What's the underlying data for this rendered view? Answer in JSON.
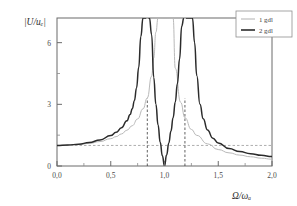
{
  "chart_data": {
    "type": "line",
    "title": "",
    "xlabel": "Ω/ωₐ",
    "ylabel": "|U/uₑ|",
    "xlim": [
      0.0,
      2.0
    ],
    "ylim": [
      0.0,
      7.2
    ],
    "grid": false,
    "legend_position": "top-right",
    "xticks": [
      "0,0",
      "0,5",
      "1,0",
      "1,5",
      "2,0"
    ],
    "xtick_values": [
      0.0,
      0.5,
      1.0,
      1.5,
      2.0
    ],
    "yticks": [
      "0",
      "3",
      "6"
    ],
    "ytick_values": [
      0,
      3,
      6
    ],
    "xtick_minor_values": [
      0.25,
      0.75,
      1.25,
      1.75
    ],
    "ytick_minor_values": [
      1.5,
      4.5
    ],
    "annotations": {
      "horizontal_reference_label": "1",
      "horizontal_reference_value": 1.0,
      "resonance_marker_left": 0.84,
      "resonance_marker_right": 1.19,
      "antiresonance": 1.0
    },
    "series": [
      {
        "name": "1 gdl",
        "color": "#b9b9b9",
        "style": "thin",
        "poles": [
          1.0
        ],
        "description": "Single degree of freedom response, one resonance peak at Ω/ω=1,0, asymptote to 1 at Ω=0",
        "x": [
          0.0,
          0.1,
          0.2,
          0.3,
          0.4,
          0.5,
          0.55,
          0.6,
          0.65,
          0.7,
          0.75,
          0.8,
          0.84,
          0.88,
          0.9,
          0.92,
          0.94,
          0.96,
          0.97,
          0.98,
          1.02,
          1.03,
          1.04,
          1.06,
          1.08,
          1.1,
          1.15,
          1.19,
          1.25,
          1.3,
          1.4,
          1.5,
          1.6,
          1.7,
          1.8,
          1.9,
          2.0
        ],
        "y": [
          1.0,
          1.01,
          1.04,
          1.1,
          1.19,
          1.33,
          1.43,
          1.56,
          1.74,
          1.96,
          2.29,
          2.78,
          3.31,
          4.37,
          5.26,
          6.51,
          7.2,
          7.2,
          7.2,
          7.2,
          7.2,
          7.2,
          7.2,
          7.2,
          7.2,
          4.76,
          3.1,
          2.35,
          1.78,
          1.49,
          1.08,
          0.8,
          0.64,
          0.53,
          0.45,
          0.38,
          0.33
        ]
      },
      {
        "name": "2 gdl",
        "color": "#2b2b2b",
        "style": "thick",
        "poles": [
          0.84,
          1.19
        ],
        "zeros": [
          1.0
        ],
        "description": "Two degree of freedom (tuned absorber) response, two resonance peaks at Ω/ω≈0,84 and ≈1,19 with antiresonance (zero) at Ω/ω=1,0",
        "x": [
          0.0,
          0.1,
          0.2,
          0.3,
          0.4,
          0.5,
          0.55,
          0.6,
          0.65,
          0.68,
          0.7,
          0.72,
          0.74,
          0.76,
          0.78,
          0.8,
          0.82,
          0.83,
          0.85,
          0.86,
          0.88,
          0.9,
          0.92,
          0.94,
          0.96,
          0.98,
          1.0,
          1.02,
          1.04,
          1.06,
          1.08,
          1.1,
          1.12,
          1.14,
          1.16,
          1.18,
          1.2,
          1.22,
          1.24,
          1.26,
          1.28,
          1.3,
          1.33,
          1.36,
          1.4,
          1.45,
          1.5,
          1.6,
          1.7,
          1.8,
          1.9,
          2.0
        ],
        "y": [
          1.0,
          1.02,
          1.06,
          1.14,
          1.27,
          1.48,
          1.64,
          1.86,
          2.2,
          2.5,
          2.78,
          3.18,
          3.8,
          4.8,
          6.3,
          7.2,
          7.2,
          7.2,
          7.2,
          7.2,
          6.4,
          4.3,
          3.0,
          2.0,
          1.15,
          0.5,
          0.0,
          0.55,
          1.12,
          1.7,
          2.35,
          3.1,
          4.0,
          5.2,
          6.8,
          7.2,
          7.2,
          7.2,
          7.2,
          7.2,
          6.0,
          4.4,
          3.0,
          2.3,
          1.75,
          1.35,
          1.12,
          0.85,
          0.7,
          0.6,
          0.52,
          0.46
        ]
      }
    ],
    "legend": [
      {
        "label": "1 gdl",
        "color": "#b9b9b9"
      },
      {
        "label": "2 gdl",
        "color": "#2b2b2b"
      }
    ]
  },
  "colors": {
    "background": "#ffffff",
    "axis": "#6b6b6b",
    "series_1gdl": "#b9b9b9",
    "series_2gdl": "#2b2b2b",
    "guide_horizontal": "#9a9a9a",
    "guide_vertical": "#3a3a3a"
  }
}
